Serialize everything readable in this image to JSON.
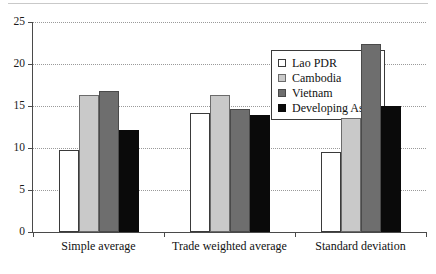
{
  "chart_data": {
    "type": "bar",
    "title": "",
    "subtitle": "",
    "xlabel": "",
    "ylabel": "",
    "categories": [
      "Simple average",
      "Trade weighted average",
      "Standard deviation"
    ],
    "series": [
      {
        "name": "Lao PDR",
        "color": "#ffffff",
        "values": [
          9.8,
          14.2,
          9.5
        ]
      },
      {
        "name": "Cambodia",
        "color": "#c9c9c9",
        "values": [
          16.3,
          16.3,
          13.6
        ]
      },
      {
        "name": "Vietnam",
        "color": "#6e6e6e",
        "values": [
          16.8,
          14.7,
          22.4
        ]
      },
      {
        "name": "Developing Asia",
        "superscript": "1",
        "color": "#0a0a0a",
        "values": [
          12.2,
          13.9,
          15.0
        ]
      }
    ],
    "ylim": [
      0,
      25
    ],
    "yticks": [
      0,
      5,
      10,
      15,
      20,
      25
    ],
    "ytick_labels": [
      "0",
      "5",
      "10",
      "15",
      "20",
      "25"
    ],
    "grid": true,
    "grid_axis": "y",
    "legend_position": "top-right-inside"
  },
  "legend": {
    "entries": [
      {
        "label": "Lao PDR",
        "swatch": "white"
      },
      {
        "label": "Cambodia",
        "swatch": "light-gray"
      },
      {
        "label": "Vietnam",
        "swatch": "dark-gray"
      },
      {
        "label": "Developing Asia",
        "superscript": "1",
        "swatch": "black"
      }
    ]
  }
}
